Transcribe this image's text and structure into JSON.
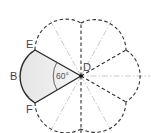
{
  "diagram": {
    "type": "geometry-sector",
    "center": {
      "label": "D",
      "x": 81,
      "y": 76
    },
    "points": [
      {
        "label": "E",
        "x": 35,
        "y": 50
      },
      {
        "label": "B",
        "x": 20,
        "y": 76
      },
      {
        "label": "F",
        "x": 35,
        "y": 103
      }
    ],
    "angle_label": "60°",
    "colors": {
      "solid_line": "#2a2a2a",
      "dashed_line": "#333333",
      "guide_line": "#bdbdbd",
      "sector_fill": "#ececec"
    }
  }
}
